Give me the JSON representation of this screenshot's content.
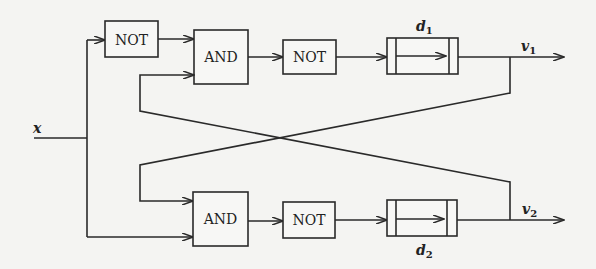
{
  "diagram": {
    "colors": {
      "background": "#f4f4f2",
      "line": "#2a2a2a",
      "text": "#222222"
    },
    "input": {
      "label": "x"
    },
    "gates": {
      "not_input": {
        "label": "NOT"
      },
      "and_top": {
        "label": "AND"
      },
      "not_top": {
        "label": "NOT"
      },
      "and_bottom": {
        "label": "AND"
      },
      "not_bottom": {
        "label": "NOT"
      }
    },
    "delays": {
      "top": {
        "label": "d",
        "subscript": "1"
      },
      "bottom": {
        "label": "d",
        "subscript": "2"
      }
    },
    "outputs": {
      "top": {
        "label": "v",
        "subscript": "1"
      },
      "bottom": {
        "label": "v",
        "subscript": "2"
      }
    },
    "connections": [
      "x -> NOT (top-left)",
      "x -> AND (bottom) input 2",
      "NOT (top-left) -> AND (top) input 1",
      "AND (top) -> NOT (top) -> d1 -> v1",
      "AND (bottom) -> NOT (bottom) -> d2 -> v2",
      "v1 feedback -> AND (bottom) input 1",
      "v2 feedback -> AND (top) input 2"
    ]
  }
}
